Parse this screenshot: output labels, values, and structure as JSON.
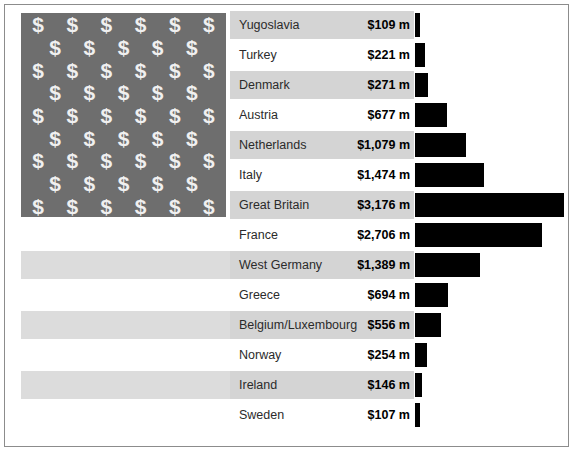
{
  "figure": {
    "width": 574,
    "height": 452,
    "border_color": "#8c8c8c",
    "background": "#ffffff"
  },
  "flag": {
    "canton_symbol": "$",
    "canton_color": "#6e6e6e",
    "canton_symbol_color": "#f0f0f0",
    "stripe_color": "#dcdcdc",
    "stripe_count": 6,
    "symbol_rows": 9,
    "symbols_per_long_row": 6,
    "symbols_per_short_row": 5
  },
  "colors": {
    "bar": "#000000",
    "row_band": "#d4d4d4",
    "label_text": "#2b2b2b",
    "value_text": "#000000"
  },
  "chart_data": {
    "type": "bar",
    "title": "",
    "subtitle": "",
    "xlabel": "",
    "ylabel": "",
    "orientation": "horizontal",
    "grid": false,
    "legend": null,
    "unit": "$ m",
    "xlim": [
      0,
      3176
    ],
    "categories": [
      "Yugoslavia",
      "Turkey",
      "Denmark",
      "Austria",
      "Netherlands",
      "Italy",
      "Great Britain",
      "France",
      "West Germany",
      "Greece",
      "Belgium/Luxembourg",
      "Norway",
      "Ireland",
      "Sweden"
    ],
    "values": [
      109,
      221,
      271,
      677,
      1079,
      1474,
      3176,
      2706,
      1389,
      694,
      556,
      254,
      146,
      107
    ],
    "value_labels": [
      "$109 m",
      "$221 m",
      "$271 m",
      "$677 m",
      "$1,079 m",
      "$1,474 m",
      "$3,176 m",
      "$2,706 m",
      "$1,389 m",
      "$694 m",
      "$556 m",
      "$254 m",
      "$146 m",
      "$107 m"
    ]
  }
}
